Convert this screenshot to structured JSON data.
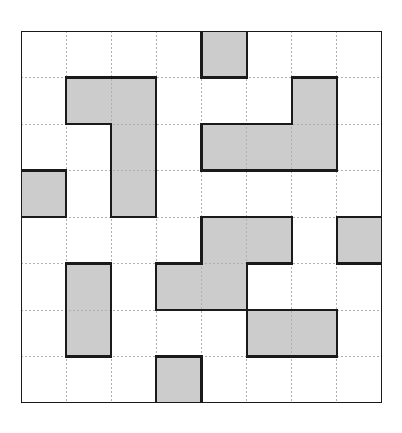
{
  "figure": {
    "title": "",
    "kind": "shaded-grid-puzzle"
  },
  "geometry": {
    "origin_x": 21,
    "origin_y": 31,
    "width": 361,
    "height": 372,
    "columns": 8,
    "rows": 8,
    "cell_width": 45.125,
    "cell_height": 46.5,
    "column_edges": [
      0,
      45.125,
      90.25,
      135.375,
      180.5,
      225.625,
      270.75,
      315.875,
      361
    ],
    "row_edges": [
      0,
      46.5,
      93,
      139.5,
      186,
      232.5,
      279,
      325.5,
      372
    ]
  },
  "colors": {
    "background": "#ffffff",
    "cell_empty": "#ffffff",
    "cell_shaded": "#cccccc",
    "outline_heavy": "#1a1a1a",
    "gridline_dotted": "#b0b0b0"
  },
  "strokes": {
    "outline_width": 2.2,
    "gridline_width": 1,
    "gridline_dash": "2 2"
  },
  "chart_data": {
    "type": "heatmap",
    "title": "",
    "xlabel": "",
    "ylabel": "",
    "columns": 8,
    "rows": 8,
    "categories_x": [
      "0",
      "1",
      "2",
      "3",
      "4",
      "5",
      "6",
      "7"
    ],
    "categories_y": [
      "0",
      "1",
      "2",
      "3",
      "4",
      "5",
      "6",
      "7"
    ],
    "legend": [
      {
        "label": "shaded",
        "value": 1,
        "color": "#cccccc"
      },
      {
        "label": "empty",
        "value": 0,
        "color": "#ffffff"
      }
    ],
    "values": [
      [
        0,
        0,
        0,
        0,
        1,
        0,
        0,
        0
      ],
      [
        0,
        1,
        1,
        0,
        0,
        0,
        1,
        0
      ],
      [
        0,
        0,
        1,
        0,
        1,
        1,
        1,
        0
      ],
      [
        1,
        0,
        1,
        0,
        0,
        0,
        0,
        0
      ],
      [
        0,
        0,
        0,
        0,
        1,
        1,
        0,
        1
      ],
      [
        0,
        1,
        0,
        1,
        1,
        0,
        0,
        0
      ],
      [
        0,
        1,
        0,
        0,
        0,
        1,
        1,
        0
      ],
      [
        0,
        0,
        0,
        1,
        0,
        0,
        0,
        0
      ]
    ],
    "shaded_cells": [
      [
        0,
        4
      ],
      [
        1,
        1
      ],
      [
        1,
        2
      ],
      [
        1,
        6
      ],
      [
        2,
        2
      ],
      [
        2,
        4
      ],
      [
        2,
        5
      ],
      [
        2,
        6
      ],
      [
        3,
        0
      ],
      [
        3,
        2
      ],
      [
        4,
        4
      ],
      [
        4,
        5
      ],
      [
        4,
        7
      ],
      [
        5,
        1
      ],
      [
        5,
        3
      ],
      [
        5,
        4
      ],
      [
        6,
        1
      ],
      [
        6,
        5
      ],
      [
        6,
        6
      ],
      [
        7,
        3
      ]
    ],
    "shaded_count": 20,
    "total_cells": 64
  }
}
